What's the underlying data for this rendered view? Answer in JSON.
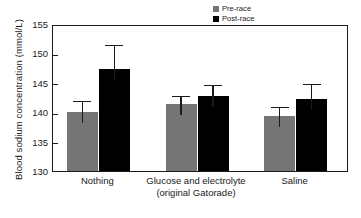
{
  "chart_data": {
    "type": "bar",
    "title": "",
    "xlabel": "",
    "ylabel": "Blood sodium concentration (mmol/L)",
    "ylim": [
      130,
      155
    ],
    "yticks": [
      130,
      135,
      140,
      145,
      150,
      155
    ],
    "grid": false,
    "legend_position": "top-right",
    "categories": [
      "Nothing",
      "Glucose and electrolyte (original Gatorade)",
      "Saline"
    ],
    "category_lines": [
      [
        "Nothing",
        ""
      ],
      [
        "Glucose and electrolyte",
        "(original Gatorade)"
      ],
      [
        "Saline",
        ""
      ]
    ],
    "series": [
      {
        "name": "Pre-race",
        "color": "#757575",
        "values": [
          140.0,
          141.4,
          139.3
        ],
        "errors": [
          2.2,
          1.7,
          2.0
        ]
      },
      {
        "name": "Post-race",
        "color": "#000000",
        "values": [
          147.4,
          142.7,
          142.3
        ],
        "errors": [
          4.4,
          2.3,
          2.9
        ]
      }
    ]
  },
  "axis": {
    "y_title": "Blood sodium concentration (mmol/L)",
    "y_tick_labels": [
      "155",
      "150",
      "145",
      "140",
      "135",
      "130"
    ]
  },
  "legend": {
    "items": [
      {
        "label": "Pre-race",
        "color": "#757575"
      },
      {
        "label": "Post-race",
        "color": "#000000"
      }
    ]
  },
  "xaxis": {
    "groups": [
      {
        "line1": "Nothing",
        "line2": ""
      },
      {
        "line1": "Glucose and electrolyte",
        "line2": "(original Gatorade)"
      },
      {
        "line1": "Saline",
        "line2": ""
      }
    ]
  }
}
